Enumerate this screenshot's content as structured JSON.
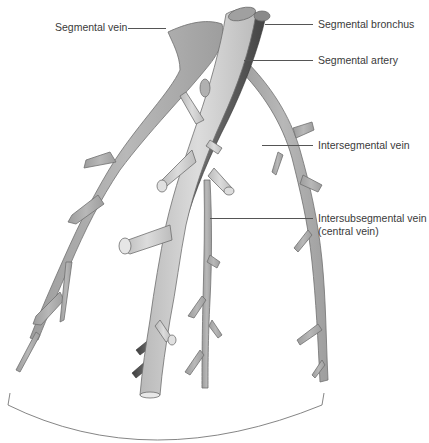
{
  "diagram": {
    "labels": {
      "segmental_vein": "Segmental vein",
      "segmental_bronchus": "Segmental bronchus",
      "segmental_artery": "Segmental artery",
      "intersegmental_vein": "Intersegmental vein",
      "intersubsegmental_vein_line1": "Intersubsegmental vein",
      "intersubsegmental_vein_line2": "(central vein)"
    },
    "colors": {
      "bronchus_fill": "#c8c8c8",
      "vein_fill": "#a9a9a9",
      "artery_fill": "#555555",
      "outline": "#6e6e6e",
      "text": "#3a3a3a",
      "background": "#ffffff"
    }
  }
}
